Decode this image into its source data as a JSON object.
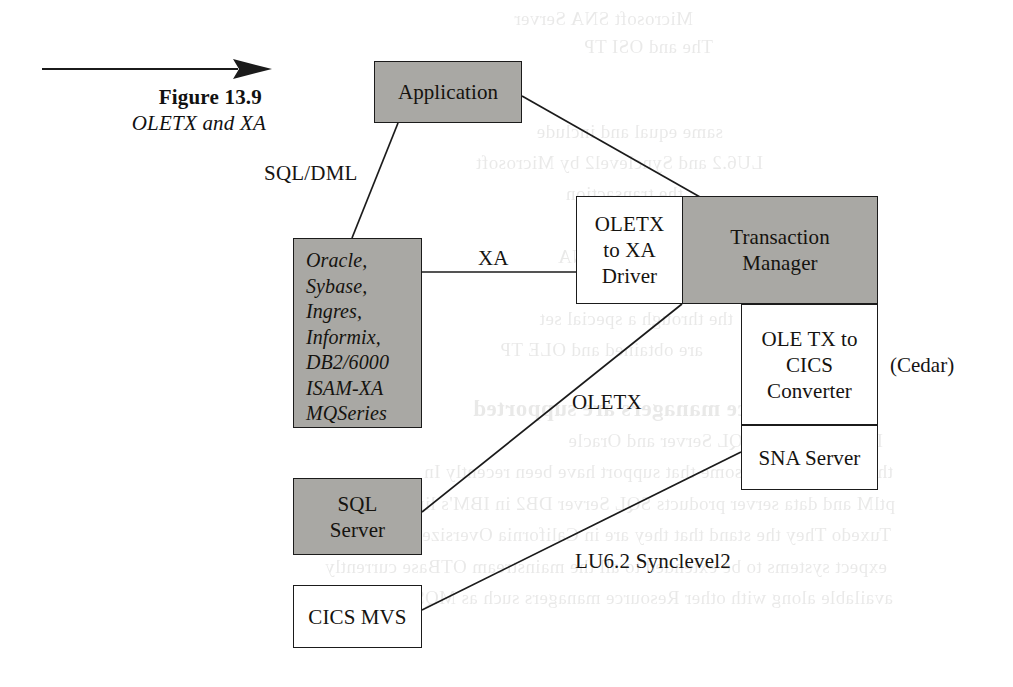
{
  "figure": {
    "arrow_icon": "right-arrow-icon",
    "number": "Figure 13.9",
    "title": "OLETX and XA"
  },
  "colors": {
    "box_fill": "#a9a8a4",
    "box_plain": "#ffffff",
    "stroke": "#1b1b1b",
    "text": "#15130f",
    "page": "#ffffff"
  },
  "nodes": {
    "application": {
      "label": "Application",
      "fill": "shaded"
    },
    "databases": {
      "fill": "shaded",
      "items": [
        "Oracle,",
        "Sybase,",
        "Ingres,",
        "Informix,",
        "DB2/6000",
        "ISAM-XA",
        "MQSeries"
      ]
    },
    "sql_server": {
      "line1": "SQL",
      "line2": "Server",
      "fill": "shaded"
    },
    "cics_mvs": {
      "label": "CICS MVS",
      "fill": "plain"
    },
    "oletx_to_xa_driver": {
      "line1": "OLETX",
      "line2": "to XA",
      "line3": "Driver",
      "fill": "plain"
    },
    "transaction_manager": {
      "line1": "Transaction",
      "line2": "Manager",
      "fill": "shaded"
    },
    "ole_tx_to_cics_converter": {
      "line1": "OLE TX to",
      "line2": "CICS",
      "line3": "Converter",
      "fill": "plain"
    },
    "sna_server": {
      "label": "SNA Server",
      "fill": "plain"
    }
  },
  "edge_labels": {
    "sql_dml": "SQL/DML",
    "xa": "XA",
    "oletx": "OLETX",
    "lu62": "LU6.2 Synclevel2"
  },
  "annotations": {
    "cedar": "(Cedar)"
  },
  "ghost_text": {
    "lines": [
      "Microsoft SNA Server",
      "The and OSI TP",
      "same equal and include",
      "LU6.2 and Synclevel2 by Microsoft",
      "the transaction",
      "a resource the SNA",
      "the through a special set",
      "are obtained and OLE TP",
      "hich resource managers are supported",
      "In the past only SQL Server and Oracle",
      "through Microsoft some that support have been recently In",
      "ptlM and data server products SQL Server DB2 in IBM's line of",
      "Tuxedo They the stand that they are in California Oversize I",
      "expect systems to be extended to all the mainstream OTBase currently",
      "available along with other Resource managers such as MQSeries MSMQ"
    ]
  }
}
